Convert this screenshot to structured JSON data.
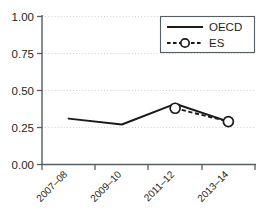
{
  "chart_data": {
    "type": "line",
    "title": "",
    "xlabel": "",
    "ylabel": "",
    "categories": [
      "2007–08",
      "2009–10",
      "2011–12",
      "2013–14"
    ],
    "ylim": [
      0.0,
      1.0
    ],
    "yticks": [
      "0.00",
      "0.25",
      "0.50",
      "0.75",
      "1.00"
    ],
    "ytick_values": [
      0.0,
      0.25,
      0.5,
      0.75,
      1.0
    ],
    "grid": true,
    "grid_axis": "y",
    "legend_position": "top-right",
    "series": [
      {
        "name": "OECD",
        "style": "solid",
        "marker": "none",
        "color": "#1a1a1a",
        "values": [
          0.31,
          0.27,
          0.41,
          0.29
        ]
      },
      {
        "name": "ES",
        "style": "dashed",
        "marker": "open-circle",
        "color": "#1a1a1a",
        "values": [
          null,
          null,
          0.38,
          0.29
        ]
      }
    ]
  },
  "axis": {
    "y_labels": [
      "1.00",
      "0.75",
      "0.50",
      "0.25",
      "0.00"
    ],
    "x_labels": [
      "2007–08",
      "2009–10",
      "2011–12",
      "2013–14"
    ]
  },
  "legend": {
    "entries": [
      {
        "label": "OECD"
      },
      {
        "label": "ES"
      }
    ]
  },
  "colors": {
    "line": "#1a1a1a",
    "axis": "#555f63",
    "grid": "#c8ccd0",
    "background": "#ffffff",
    "marker_fill": "#ffffff"
  }
}
